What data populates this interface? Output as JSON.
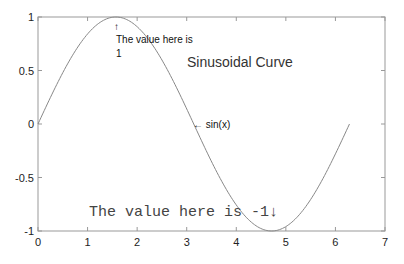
{
  "chart_data": {
    "type": "line",
    "title": "",
    "xlabel": "",
    "ylabel": "",
    "xlim": [
      0,
      7
    ],
    "ylim": [
      -1,
      1
    ],
    "grid": false,
    "xticks": [
      "0",
      "1",
      "2",
      "3",
      "4",
      "5",
      "6",
      "7"
    ],
    "yticks": [
      "-1",
      "-0.5",
      "0",
      "0.5",
      "1"
    ],
    "series": [
      {
        "name": "sin(x)",
        "function": "sin(x)",
        "x_range": [
          0,
          6.2832
        ],
        "x": [
          0,
          0.5,
          1.0,
          1.5708,
          2.0,
          2.5,
          3.1416,
          3.5,
          4.0,
          4.7124,
          5.0,
          5.5,
          6.0,
          6.2832
        ],
        "y": [
          0,
          0.479,
          0.841,
          1.0,
          0.909,
          0.598,
          0,
          -0.351,
          -0.757,
          -1.0,
          -0.959,
          -0.706,
          -0.279,
          0
        ],
        "color": "#888888"
      }
    ],
    "annotations": [
      {
        "text_line1": "↑",
        "text_line2": "The value here is",
        "text_line3": "1",
        "x": 1.5708,
        "y": 1.0
      },
      {
        "text": "Sinusoidal Curve",
        "x": 3.5,
        "y": 0.6
      },
      {
        "text": "← sin(x)",
        "x": 3.1416,
        "y": 0
      },
      {
        "text": "The value here is -1↓",
        "x": 1.0,
        "y": -0.85
      }
    ]
  }
}
